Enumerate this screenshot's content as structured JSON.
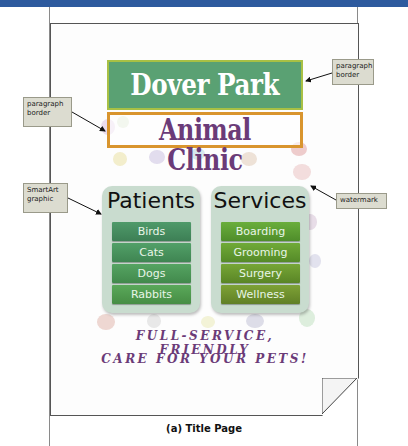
{
  "document": {
    "title_line1": "Dover Park",
    "title_line2": "Animal Clinic",
    "smartart": {
      "columns": [
        {
          "heading": "Patients",
          "items": [
            "Birds",
            "Cats",
            "Dogs",
            "Rabbits"
          ]
        },
        {
          "heading": "Services",
          "items": [
            "Boarding",
            "Grooming",
            "Surgery",
            "Wellness"
          ]
        }
      ]
    },
    "tagline_line1": "Full-Service, Friendly",
    "tagline_line2": "Care for Your Pets!"
  },
  "callouts": {
    "paragraph_border_right": [
      "paragraph",
      "border"
    ],
    "paragraph_border_left": [
      "paragraph",
      "border"
    ],
    "smartart_graphic": [
      "SmartArt",
      "graphic"
    ],
    "watermark": [
      "watermark"
    ]
  },
  "caption": "(a) Title Page",
  "colors": {
    "topbar": "#2d5a9e",
    "title_bg": "#5aa173",
    "title_border": "#a8c044",
    "clinic_text": "#6b3b78",
    "clinic_border": "#d9952e",
    "smartart_bg": "#c9dccf"
  }
}
